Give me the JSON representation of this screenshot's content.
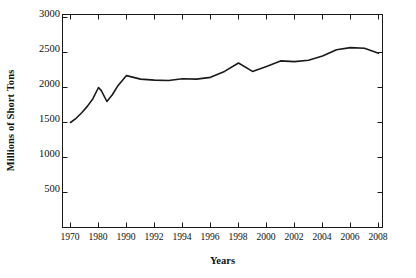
{
  "chart_data": {
    "type": "line",
    "title": "",
    "xlabel": "Years",
    "ylabel": "Millions of Short Tons",
    "ylim": [
      0,
      3000
    ],
    "y_ticks": [
      500,
      1000,
      1500,
      2000,
      2500,
      3000
    ],
    "grid": false,
    "legend": "none",
    "axis_style": "box-frame-with-inward-ticks",
    "categories": [
      "1970",
      "1980",
      "1990",
      "1992",
      "1994",
      "1996",
      "1998",
      "2000",
      "2002",
      "2004",
      "2006",
      "2008"
    ],
    "series": [
      {
        "name": "Coal Production",
        "color": "#1a1a1a",
        "x": [
          1970,
          1972,
          1974,
          1976,
          1978,
          1980,
          1981,
          1983,
          1985,
          1987,
          1990,
          1991,
          1992,
          1993,
          1994,
          1995,
          1996,
          1997,
          1998,
          1999,
          2000,
          2001,
          2002,
          2003,
          2004,
          2005,
          2006,
          2007,
          2008
        ],
        "values": [
          1500,
          1560,
          1640,
          1730,
          1840,
          2000,
          1955,
          1800,
          1900,
          2030,
          2170,
          2120,
          2105,
          2100,
          2125,
          2120,
          2145,
          2230,
          2350,
          2230,
          2300,
          2380,
          2370,
          2390,
          2450,
          2540,
          2570,
          2560,
          2490
        ]
      }
    ]
  },
  "x_tick_labels": [
    "1970",
    "1980",
    "1990",
    "1992",
    "1994",
    "1996",
    "1998",
    "2000",
    "2002",
    "2004",
    "2006",
    "2008"
  ],
  "y_tick_labels": [
    "3000",
    "2500",
    "2000",
    "1500",
    "1000",
    "500"
  ]
}
